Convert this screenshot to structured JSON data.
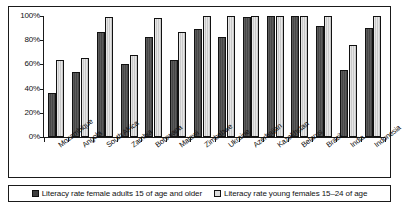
{
  "chart_data": {
    "type": "bar",
    "title": "",
    "subtitle": "",
    "xlabel": "",
    "ylabel": "",
    "ylim": [
      0,
      100
    ],
    "ytick_values": [
      0,
      20,
      40,
      60,
      80,
      100
    ],
    "ytick_labels": [
      "0%",
      "20%",
      "40%",
      "60%",
      "80%",
      "100%"
    ],
    "grid": false,
    "legend_position": "bottom",
    "value_unit": "%",
    "categories": [
      "Mozambique",
      "Angola",
      "South Africa",
      "Zambia",
      "Botswana",
      "Malawi",
      "Zimbabwe",
      "Ukraine",
      "Azerbaijan",
      "Kazakhstan",
      "Belarus",
      "Brazil",
      "India",
      "Indonesia"
    ],
    "series": [
      {
        "name": "Literacy rate female adults 15 of age and older",
        "color": "#4a4a4a",
        "values": [
          36,
          54,
          87,
          60,
          83,
          64,
          89,
          83,
          99,
          100,
          100,
          92,
          55,
          90
        ]
      },
      {
        "name": "Literacy rate young females 15–24 of age",
        "color": "#d2d2d2",
        "values": [
          64,
          65,
          99,
          68,
          98,
          87,
          100,
          100,
          100,
          100,
          100,
          100,
          76,
          100
        ]
      }
    ]
  },
  "legend": {
    "items": [
      {
        "label": "Literacy rate female adults 15 of age and older",
        "swatch": "dark-gray-swatch"
      },
      {
        "label": "Literacy rate young females 15–24 of age",
        "swatch": "light-gray-swatch"
      }
    ]
  }
}
